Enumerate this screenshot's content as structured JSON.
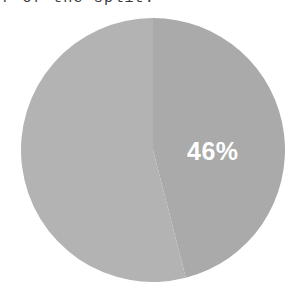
{
  "caption": {
    "text": "r of the split.",
    "truncated": true
  },
  "chart_data": {
    "type": "pie",
    "title": "",
    "subtitle": "",
    "xlabel": "",
    "ylabel": "",
    "grid": false,
    "legend_position": "none",
    "categories": [
      "Slice A",
      "Slice B"
    ],
    "values": [
      54,
      46
    ],
    "labels": [
      "",
      "46%"
    ],
    "visible_labels": [
      "46%"
    ],
    "colors": [
      "#b3b3b3",
      "#aaaaaa"
    ],
    "label_color": "#ffffff",
    "background": "#ffffff",
    "start_angle_deg": 0,
    "direction": "clockwise",
    "slices": [
      {
        "name": "Slice A",
        "value": 54,
        "percent": "54%",
        "label_shown": "",
        "color": "#b3b3b3",
        "start_deg": 180,
        "end_deg": 360
      },
      {
        "name": "Slice B",
        "value": 46,
        "percent": "46%",
        "label_shown": "46%",
        "color": "#aaaaaa",
        "start_deg": 0,
        "end_deg": 180
      }
    ]
  }
}
